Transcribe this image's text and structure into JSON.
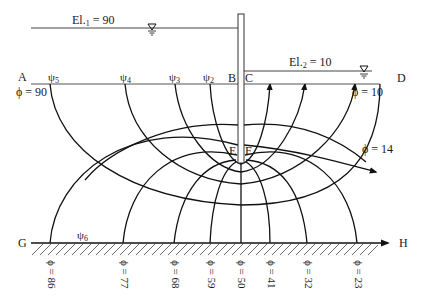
{
  "water_levels": {
    "upstream": {
      "label_prefix": "El.",
      "subscript": "1",
      "value_text": " = 90"
    },
    "downstream": {
      "label_prefix": "El.",
      "subscript": "2",
      "value_text": " = 10"
    }
  },
  "points": {
    "A": "A",
    "B": "B",
    "C": "C",
    "D": "D",
    "E": "E",
    "F": "F",
    "G": "G",
    "H": "H"
  },
  "flow_lines": [
    {
      "symbol": "ψ",
      "sub": "5"
    },
    {
      "symbol": "ψ",
      "sub": "4"
    },
    {
      "symbol": "ψ",
      "sub": "3"
    },
    {
      "symbol": "ψ",
      "sub": "2"
    },
    {
      "symbol": "ψ",
      "sub": "6"
    }
  ],
  "equipotential_labels": {
    "upstream": "ϕ = 90",
    "downstream": "ϕ = 10",
    "side": "ϕ = 14"
  },
  "bottom_equipotentials": [
    "ϕ = 86",
    "ϕ = 77",
    "ϕ = 68",
    "ϕ = 59",
    "ϕ = 50",
    "ϕ = 41",
    "ϕ = 32",
    "ϕ = 23"
  ],
  "colors": {
    "line": "#111111",
    "pile": "#ffffff",
    "ground": "#333333"
  }
}
